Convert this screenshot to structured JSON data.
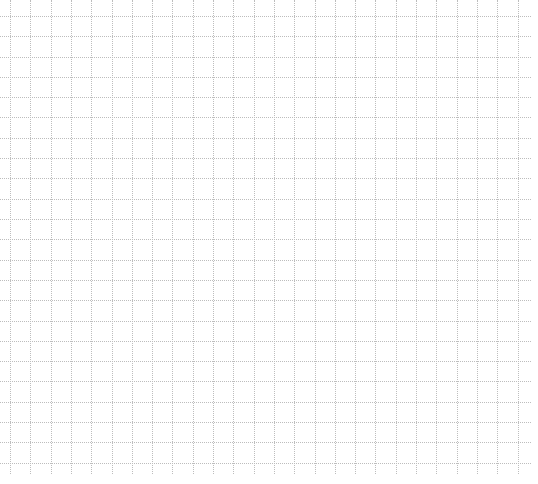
{
  "grid": {
    "background": "#ffffff",
    "line_color": "#bdbdbd",
    "line_style": "dotted",
    "cell_size_px": 20.3,
    "first_vertical_x": 10,
    "first_horizontal_y": 16,
    "right_edge_x": 531,
    "bottom_edge_y": 474
  }
}
